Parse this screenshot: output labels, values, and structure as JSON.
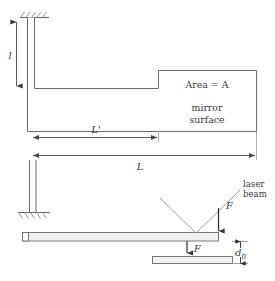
{
  "figure": {
    "type": "mechanical-schematic",
    "background_color": "#ffffff",
    "line_color": "#555555",
    "text_color": "#3a3a3a",
    "fill_color": "#e9e9e9"
  },
  "labels": {
    "length_l": "l",
    "area": "Area = A",
    "mirror_line1": "mirror",
    "mirror_line2": "surface",
    "l_prime": "L'",
    "capital_l": "L",
    "laser_line1": "laser",
    "laser_line2": "beam",
    "force_upper": "F",
    "force_lower": "F",
    "gap": "d",
    "gap_subscript": "0"
  },
  "icons": {
    "ceiling_support": "hatched-ground-icon",
    "floor_support": "hatched-ground-icon",
    "arrow_double": "double-headed-arrow-icon",
    "arrow_down": "down-arrow-icon",
    "laser_incident": "laser-incident-ray-icon",
    "laser_reflected": "laser-reflected-ray-icon"
  },
  "geometry": {
    "upper_assembly": {
      "vertical_post": {
        "x": 27,
        "y_top": 17,
        "y_bottom": 140,
        "width": 7
      },
      "horizontal_arm_top_y": 88,
      "horizontal_arm_bottom_y": 131,
      "mirror_block": {
        "x": 158,
        "y": 70,
        "width": 98,
        "height": 61
      }
    },
    "dimension_l": {
      "x": 16,
      "y_top": 22,
      "y_bottom": 86
    },
    "dimension_l_prime": {
      "y": 137,
      "x_start": 32,
      "x_end": 158
    },
    "dimension_L": {
      "y": 155,
      "x_start": 32,
      "x_end": 256
    },
    "lower_assembly": {
      "post": {
        "x": 32,
        "y_top": 178,
        "y_bottom": 212
      },
      "cantilever": {
        "x": 22,
        "y": 232,
        "width": 196,
        "height": 9
      },
      "base_plate": {
        "x": 152,
        "y": 256,
        "width": 80,
        "height": 8
      },
      "gap_top_y": 241,
      "gap_bottom_y": 256
    },
    "laser": {
      "incident_start": [
        160,
        198
      ],
      "vertex": [
        196,
        234
      ],
      "reflected_end": [
        232,
        198
      ]
    }
  }
}
